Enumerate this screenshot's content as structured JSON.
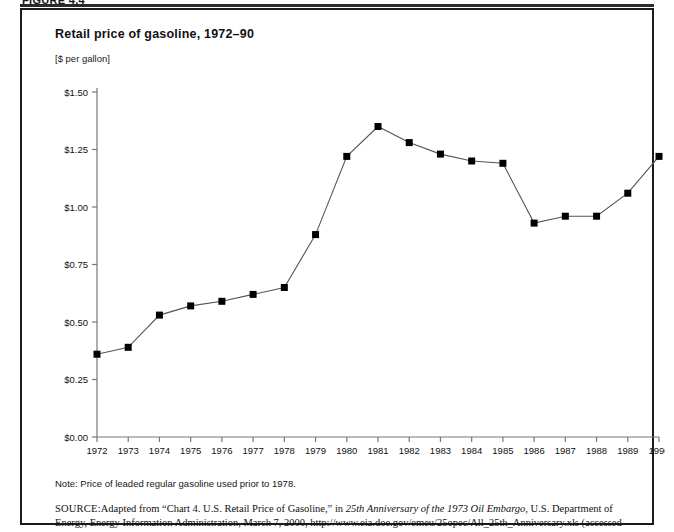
{
  "figure": {
    "label": "FIGURE 4.4",
    "title": "Retail price of gasoline, 1972–90",
    "unit_label": "[$ per gallon]",
    "note": "Note: Price of leaded regular gasoline used prior to 1978.",
    "source_label": "SOURCE:",
    "source_part1": "Adapted from “Chart 4. U.S. Retail Price of Gasoline,” in ",
    "source_italic": "25th Anniversary of the 1973 Oil Embargo",
    "source_part2": ", U.S. Department of Energy, Energy Information Administration, March 7, 2000, http://www.eia.doe.gov/emeu/25opec/All_25th_Anniversary.xls (accessed September 10, 2012)"
  },
  "colors": {
    "line": "#555555",
    "marker": "#000000",
    "axis": "#777777",
    "border": "#1b1b1b",
    "text": "#111111"
  },
  "chart_data": {
    "type": "line",
    "title": "Retail price of gasoline, 1972–90",
    "xlabel": "",
    "ylabel": "[$ per gallon]",
    "ylim": [
      0.0,
      1.5
    ],
    "ytick_values": [
      0.0,
      0.25,
      0.5,
      0.75,
      1.0,
      1.25,
      1.5
    ],
    "ytick_labels": [
      "$0.00",
      "$0.25",
      "$0.50",
      "$0.75",
      "$1.00",
      "$1.25",
      "$1.50"
    ],
    "grid": false,
    "legend": "none",
    "marker": "square",
    "categories": [
      "1972",
      "1973",
      "1974",
      "1975",
      "1976",
      "1977",
      "1978",
      "1979",
      "1980",
      "1981",
      "1982",
      "1983",
      "1984",
      "1985",
      "1986",
      "1987",
      "1988",
      "1989",
      "1990"
    ],
    "values": [
      0.36,
      0.39,
      0.53,
      0.57,
      0.59,
      0.62,
      0.65,
      0.88,
      1.22,
      1.35,
      1.28,
      1.23,
      1.2,
      1.19,
      0.93,
      0.96,
      0.96,
      1.06,
      1.22
    ],
    "series": [
      {
        "name": "Retail price of gasoline ($ per gallon)",
        "values": [
          0.36,
          0.39,
          0.53,
          0.57,
          0.59,
          0.62,
          0.65,
          0.88,
          1.22,
          1.35,
          1.28,
          1.23,
          1.2,
          1.19,
          0.93,
          0.96,
          0.96,
          1.06,
          1.22
        ]
      }
    ]
  }
}
